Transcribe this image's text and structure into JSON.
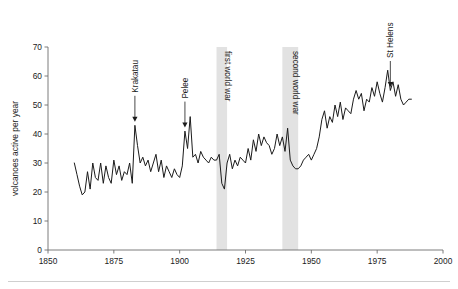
{
  "figure": {
    "background_color": "#ffffff",
    "line_color": "#1b1b1b",
    "band_color": "#e2e2e2",
    "axis_color": "#6e6e6e"
  },
  "chart_data": {
    "type": "line",
    "title": "",
    "xlabel": "",
    "ylabel": "volcanoes active per year",
    "xlim": [
      1850,
      2000
    ],
    "ylim": [
      0,
      70
    ],
    "grid": false,
    "legend": "none",
    "xticks": [
      1850,
      1875,
      1900,
      1925,
      1950,
      1975,
      2000
    ],
    "xtick_labels": [
      "1850",
      "1875",
      "1900",
      "1925",
      "1950",
      "1975",
      "2000"
    ],
    "yticks": [
      0,
      10,
      20,
      30,
      40,
      50,
      60,
      70
    ],
    "ytick_labels": [
      "0",
      "10",
      "20",
      "30",
      "40",
      "50",
      "60",
      "70"
    ],
    "series": [
      {
        "name": "volcanoes active per year",
        "x": [
          1860,
          1861,
          1862,
          1863,
          1864,
          1865,
          1866,
          1867,
          1868,
          1869,
          1870,
          1871,
          1872,
          1873,
          1874,
          1875,
          1876,
          1877,
          1878,
          1879,
          1880,
          1881,
          1882,
          1883,
          1884,
          1885,
          1886,
          1887,
          1888,
          1889,
          1890,
          1891,
          1892,
          1893,
          1894,
          1895,
          1896,
          1897,
          1898,
          1899,
          1900,
          1901,
          1902,
          1903,
          1904,
          1905,
          1906,
          1907,
          1908,
          1909,
          1910,
          1911,
          1912,
          1913,
          1914,
          1915,
          1916,
          1917,
          1918,
          1919,
          1920,
          1921,
          1922,
          1923,
          1924,
          1925,
          1926,
          1927,
          1928,
          1929,
          1930,
          1931,
          1932,
          1933,
          1934,
          1935,
          1936,
          1937,
          1938,
          1939,
          1940,
          1941,
          1942,
          1943,
          1944,
          1945,
          1946,
          1947,
          1948,
          1949,
          1950,
          1951,
          1952,
          1953,
          1954,
          1955,
          1956,
          1957,
          1958,
          1959,
          1960,
          1961,
          1962,
          1963,
          1964,
          1965,
          1966,
          1967,
          1968,
          1969,
          1970,
          1971,
          1972,
          1973,
          1974,
          1975,
          1976,
          1977,
          1978,
          1979,
          1980,
          1981,
          1982,
          1983,
          1984,
          1985,
          1986,
          1987,
          1988
        ],
        "values": [
          30,
          26,
          22,
          19,
          20,
          27,
          21,
          30,
          25,
          24,
          30,
          23,
          29,
          25,
          23,
          31,
          26,
          29,
          24,
          27,
          26,
          30,
          23,
          43,
          36,
          30,
          32,
          29,
          31,
          27,
          30,
          33,
          27,
          31,
          25,
          29,
          27,
          25,
          28,
          26,
          25,
          29,
          41,
          35,
          46,
          32,
          33,
          30,
          34,
          32,
          31,
          30,
          32,
          31,
          31,
          33,
          23,
          21,
          30,
          33,
          28,
          31,
          29,
          32,
          31,
          30,
          35,
          31,
          38,
          34,
          40,
          36,
          39,
          37,
          36,
          33,
          35,
          40,
          36,
          39,
          34,
          42,
          31,
          29,
          28,
          28,
          29,
          31,
          32,
          33,
          31,
          33,
          35,
          39,
          45,
          48,
          42,
          46,
          44,
          50,
          46,
          51,
          45,
          49,
          48,
          47,
          52,
          55,
          52,
          54,
          48,
          52,
          51,
          56,
          53,
          58,
          54,
          51,
          56,
          62,
          55,
          58,
          53,
          57,
          52,
          50,
          51,
          52,
          52
        ]
      }
    ],
    "annotations": [
      {
        "label": "Krakatau",
        "x": 1883,
        "y": 43,
        "type": "arrow-down"
      },
      {
        "label": "Pelee",
        "x": 1902,
        "y": 41,
        "type": "arrow-down"
      },
      {
        "label": "St Helens",
        "x": 1980,
        "y": 55,
        "type": "arrow-down"
      }
    ],
    "bands": [
      {
        "label": "first world war",
        "x0": 1914,
        "x1": 1918
      },
      {
        "label": "second world war",
        "x0": 1939,
        "x1": 1945
      }
    ]
  }
}
